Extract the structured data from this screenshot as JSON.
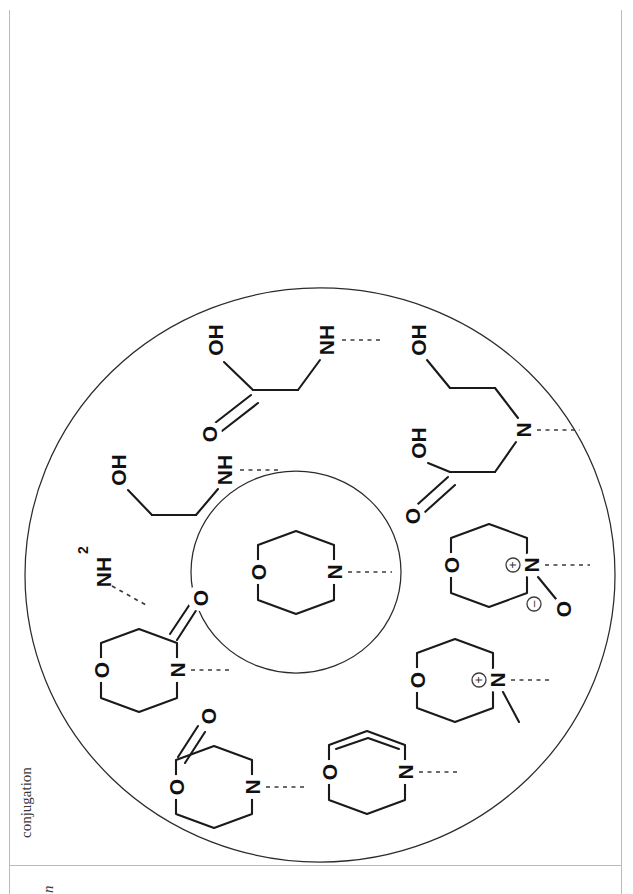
{
  "page": {
    "margin_text_left": "conjugation",
    "margin_text_bottom": "n",
    "background": "#ffffff",
    "rule_color": "#b9b9b9"
  },
  "figure": {
    "orientation": "rotated-90-ccw",
    "rings": [
      {
        "name": "outer-ellipse",
        "cx": 320,
        "cy": 575,
        "rx": 295,
        "ry": 285
      },
      {
        "name": "inner-ellipse",
        "cx": 296,
        "cy": 572,
        "rx": 105,
        "ry": 100
      }
    ],
    "core": {
      "name": "morpholine-core",
      "atoms": [
        "O",
        "N"
      ],
      "attachment": "dashed-bond-from-N"
    },
    "structures": [
      {
        "id": "carboxymethylamino",
        "labels": [
          "OH",
          "NH"
        ],
        "description": "HO-C(=O)-CH2-NH- glycine fragment",
        "carbonyl": "O"
      },
      {
        "id": "hydroxyethylamino",
        "labels": [
          "OH",
          "NH"
        ],
        "description": "HO-CH2-CH2-NH- ethanolamine fragment"
      },
      {
        "id": "amino",
        "labels": [
          "NH2"
        ],
        "description": "primary amine NH2 with dashed attachment"
      },
      {
        "id": "morpholin-3-one",
        "labels": [
          "O",
          "N",
          "O"
        ],
        "description": "morpholine lactam ring, C=O adjacent to N"
      },
      {
        "id": "morpholin-2-one",
        "labels": [
          "O",
          "O",
          "N"
        ],
        "description": "morpholine lactone ring, C=O adjacent to ring O"
      },
      {
        "id": "dehydromorpholine",
        "labels": [
          "O",
          "N"
        ],
        "description": "morpholine ring bearing an endocyclic C=C double bond"
      },
      {
        "id": "morpholine-n-oxide",
        "labels": [
          "O",
          "N",
          "O"
        ],
        "charges": [
          "+",
          "−"
        ],
        "description": "morpholine N-oxide, N(+)-O(-)"
      },
      {
        "id": "n-methylmorpholinium",
        "labels": [
          "O",
          "N"
        ],
        "charges": [
          "+"
        ],
        "description": "quaternary N-methyl morpholinium"
      },
      {
        "id": "bis-substituted-amine",
        "labels": [
          "OH",
          "OH",
          "N"
        ],
        "description": "tertiary N with hydroxyethyl and carboxymethyl arms",
        "carbonyl": "O"
      }
    ],
    "atom_glyphs": {
      "oxygen": "O",
      "nitrogen": "N",
      "hydroxyl": "OH",
      "amine_secondary": "NH",
      "amine_primary_base": "NH",
      "amine_primary_sub": "2",
      "plus": "+",
      "minus": "−"
    }
  }
}
